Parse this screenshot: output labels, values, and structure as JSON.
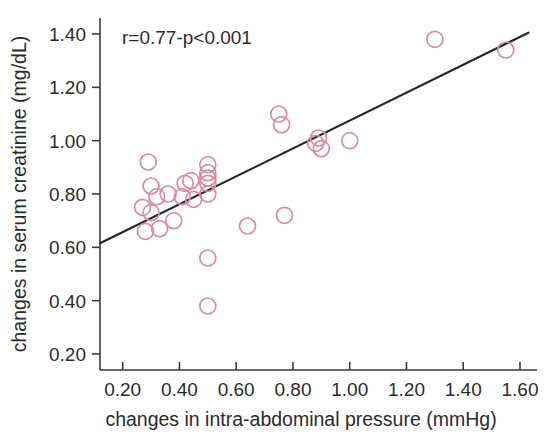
{
  "chart_data": {
    "type": "scatter",
    "title": "",
    "xlabel": "changes in intra-abdominal pressure (mmHg)",
    "ylabel": "changes in serum creatinine (mg/dL)",
    "xlim": [
      0.12,
      1.66
    ],
    "ylim": [
      0.14,
      1.46
    ],
    "xticks": [
      "0.20",
      "0.40",
      "0.60",
      "0.80",
      "1.00",
      "1.20",
      "1.40",
      "1.60"
    ],
    "xtick_values": [
      0.2,
      0.4,
      0.6,
      0.8,
      1.0,
      1.2,
      1.4,
      1.6
    ],
    "yticks": [
      "0.20",
      "0.40",
      "0.60",
      "0.80",
      "1.00",
      "1.20",
      "1.40"
    ],
    "ytick_values": [
      0.2,
      0.4,
      0.6,
      0.8,
      1.0,
      1.2,
      1.4
    ],
    "grid": false,
    "legend": false,
    "annotation": "r=0.77-p<0.001",
    "annotation_r": "0.77",
    "annotation_p": "<0.001",
    "marker": "open-circle",
    "marker_color": "#d98a9e",
    "marker_radius_px": 8,
    "fit_line": {
      "label": "regression line",
      "color": "#262626",
      "x_start": 0.12,
      "y_start": 0.615,
      "x_end": 1.63,
      "y_end": 1.405
    },
    "x": [
      0.27,
      0.28,
      0.29,
      0.3,
      0.3,
      0.32,
      0.33,
      0.36,
      0.38,
      0.41,
      0.42,
      0.44,
      0.45,
      0.5,
      0.5,
      0.5,
      0.5,
      0.5,
      0.5,
      0.5,
      0.64,
      0.75,
      0.76,
      0.77,
      0.88,
      0.89,
      0.9,
      1.0,
      1.3,
      1.55
    ],
    "y": [
      0.75,
      0.66,
      0.92,
      0.83,
      0.73,
      0.79,
      0.67,
      0.8,
      0.7,
      0.79,
      0.84,
      0.85,
      0.78,
      0.91,
      0.88,
      0.86,
      0.84,
      0.8,
      0.56,
      0.38,
      0.68,
      1.1,
      1.06,
      0.72,
      0.99,
      1.01,
      0.97,
      1.0,
      1.38,
      1.34
    ],
    "n_points": 30
  },
  "axes": {
    "x_axis_name": "x-axis",
    "y_axis_name": "y-axis"
  }
}
